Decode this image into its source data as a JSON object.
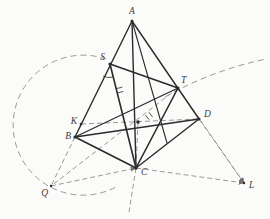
{
  "figure": {
    "background": "#fbfbfa",
    "solid_color": "#2b2b2b",
    "dashed_color": "#8f8f8f",
    "label_color": "#3c3c3c",
    "label_font_size": 9.5
  },
  "diagram": {
    "points": {
      "A": [
        132,
        21
      ],
      "S": [
        110,
        64
      ],
      "K": [
        81,
        124
      ],
      "B": [
        75,
        137
      ],
      "Q": [
        51,
        186
      ],
      "T": [
        178,
        88
      ],
      "D": [
        199,
        119
      ],
      "C": [
        136,
        168
      ],
      "L": [
        244,
        183
      ],
      "M": [
        138,
        122
      ],
      "F": [
        167,
        143
      ],
      "Cx": [
        129,
        212
      ]
    },
    "labels": [
      {
        "id": "A",
        "text": "A",
        "x": 132,
        "y": 14,
        "anchor": "middle"
      },
      {
        "id": "S",
        "text": "S",
        "x": 105,
        "y": 60,
        "anchor": "end"
      },
      {
        "id": "T",
        "text": "T",
        "x": 181,
        "y": 83,
        "anchor": "start"
      },
      {
        "id": "K",
        "text": "K",
        "x": 77,
        "y": 124,
        "anchor": "end"
      },
      {
        "id": "B",
        "text": "B",
        "x": 71,
        "y": 139,
        "anchor": "end"
      },
      {
        "id": "D",
        "text": "D",
        "x": 204,
        "y": 117,
        "anchor": "start"
      },
      {
        "id": "C",
        "text": "C",
        "x": 141,
        "y": 175,
        "anchor": "start"
      },
      {
        "id": "Q",
        "text": "Q",
        "x": 48,
        "y": 196,
        "anchor": "end"
      },
      {
        "id": "L",
        "text": "L",
        "x": 249,
        "y": 188,
        "anchor": "start"
      }
    ],
    "solid_segments": [
      {
        "from": "A",
        "to": "B",
        "w": 1.4
      },
      {
        "from": "A",
        "to": "D",
        "w": 1.4
      },
      {
        "from": "A",
        "to": "C",
        "w": 1.4
      },
      {
        "from": "A",
        "to": "F",
        "w": 1.1
      },
      {
        "from": "S",
        "to": "C",
        "w": 1.6
      },
      {
        "from": "S",
        "to": "T",
        "w": 1.6
      },
      {
        "from": "T",
        "to": "C",
        "w": 1.6
      },
      {
        "from": "T",
        "to": "B",
        "w": 1.2
      },
      {
        "from": "B",
        "to": "C",
        "w": 1.6
      },
      {
        "from": "B",
        "to": "D",
        "w": 1.4
      },
      {
        "from": "C",
        "to": "D",
        "w": 1.4
      }
    ],
    "dashed_segments": [
      {
        "from": "B",
        "to": "Q",
        "arrow": false
      },
      {
        "from": "K",
        "to": "D",
        "arrow": false
      },
      {
        "from": "T",
        "to": "Q",
        "arrow": false
      },
      {
        "from": "Q",
        "to": "C",
        "arrow": true
      },
      {
        "from": "C",
        "to": "L",
        "arrow": true
      },
      {
        "from": "D",
        "to": "L",
        "arrow": true
      },
      {
        "from": "T",
        "to": "L",
        "arrow": true
      },
      {
        "from": "M",
        "to": "C",
        "arrow": false
      },
      {
        "from": "C",
        "to": "Cx",
        "arrow": false
      }
    ],
    "arcs": [
      {
        "name": "left-compass-circle",
        "path": "M 106 59 A 70 70 0 1 0 116 187"
      },
      {
        "name": "right-compass-arc",
        "path": "M 165 97 C 185 86 215 70 266 59"
      }
    ],
    "dots": [
      {
        "id": "A",
        "r": 1.5
      },
      {
        "id": "S",
        "r": 1.6
      },
      {
        "id": "T",
        "r": 1.6
      },
      {
        "id": "K",
        "r": 1.3
      },
      {
        "id": "B",
        "r": 1.6
      },
      {
        "id": "D",
        "r": 1.6
      },
      {
        "id": "C",
        "r": 1.7
      },
      {
        "id": "M",
        "r": 1.8
      },
      {
        "id": "Q",
        "r": 1.2
      },
      {
        "id": "L",
        "r": 1.2
      }
    ],
    "marks": [
      {
        "name": "angle-mark-at-S",
        "type": "arc",
        "path": "M 113 77 A 13 13 0 0 1 103 76"
      },
      {
        "name": "tick-mark-1",
        "type": "tick",
        "x": 120,
        "y": 90,
        "angle": 76
      },
      {
        "name": "tick-mark-2",
        "type": "tick",
        "x": 149,
        "y": 116,
        "angle": 142
      }
    ]
  }
}
